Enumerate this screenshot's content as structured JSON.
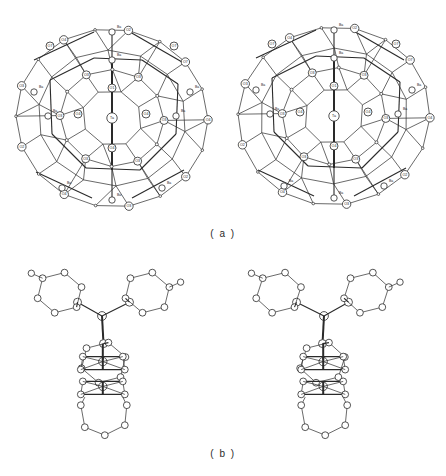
{
  "figure": {
    "type": "crystal-structure-stereo-pair",
    "background_color": "#ffffff",
    "line_color": "#2a2a2a"
  },
  "panels": [
    {
      "id": "a",
      "caption": "( a )",
      "description": "stereo pair of coordination polyhedron cage",
      "views": [
        "left-eye",
        "right-eye"
      ]
    },
    {
      "id": "b",
      "caption": "( b )",
      "description": "stereo pair of Y-shaped fragment",
      "views": [
        "left-eye",
        "right-eye"
      ]
    }
  ],
  "captions": {
    "a": "( a )",
    "b": "( b )"
  },
  "atom_labels": {
    "center": "Ta",
    "cation": "Ba",
    "oxygen_2": "O2",
    "oxygen_3": "O3",
    "oxygen_4": "O4",
    "oxygen_7": "O7",
    "oxygen_1": "O1"
  },
  "chart_data": {
    "type": "scatter",
    "title": "",
    "xlabel": "",
    "ylabel": "",
    "panel_a": {
      "labeled_atoms_left": [
        {
          "label": "O4",
          "x": 37,
          "y": 40
        },
        {
          "label": "Ba",
          "x": 119,
          "y": 30
        },
        {
          "label": "O4",
          "x": 170,
          "y": 40
        },
        {
          "label": "O7",
          "x": 72,
          "y": 72
        },
        {
          "label": "O4",
          "x": 120,
          "y": 65
        },
        {
          "label": "O3",
          "x": 155,
          "y": 68
        },
        {
          "label": "O7",
          "x": 167,
          "y": 70
        },
        {
          "label": "O4",
          "x": 24,
          "y": 90
        },
        {
          "label": "O3",
          "x": 38,
          "y": 89
        },
        {
          "label": "Ba",
          "x": 113,
          "y": 85
        },
        {
          "label": "O3",
          "x": 196,
          "y": 86
        },
        {
          "label": "O2",
          "x": 64,
          "y": 108
        },
        {
          "label": "O3",
          "x": 80,
          "y": 120
        },
        {
          "label": "O1",
          "x": 113,
          "y": 113
        },
        {
          "label": "O2",
          "x": 160,
          "y": 105
        },
        {
          "label": "O3",
          "x": 166,
          "y": 122
        },
        {
          "label": "Ba",
          "x": 178,
          "y": 126
        },
        {
          "label": "O2",
          "x": 23,
          "y": 139
        },
        {
          "label": "Ta",
          "x": 119,
          "y": 136
        },
        {
          "label": "O2",
          "x": 207,
          "y": 136
        },
        {
          "label": "Ba",
          "x": 57,
          "y": 131
        },
        {
          "label": "Ba",
          "x": 36,
          "y": 152
        },
        {
          "label": "O4",
          "x": 80,
          "y": 152
        },
        {
          "label": "O4",
          "x": 148,
          "y": 152
        },
        {
          "label": "Ba",
          "x": 194,
          "y": 152
        },
        {
          "label": "O4",
          "x": 128,
          "y": 167
        },
        {
          "label": "O3",
          "x": 40,
          "y": 177
        },
        {
          "label": "O3",
          "x": 203,
          "y": 175
        },
        {
          "label": "O2",
          "x": 70,
          "y": 186
        },
        {
          "label": "O2",
          "x": 78,
          "y": 187
        },
        {
          "label": "O1",
          "x": 117,
          "y": 185
        },
        {
          "label": "O2",
          "x": 167,
          "y": 186
        },
        {
          "label": "O2",
          "x": 176,
          "y": 187
        },
        {
          "label": "O4",
          "x": 30,
          "y": 196
        },
        {
          "label": "O4",
          "x": 211,
          "y": 193
        },
        {
          "label": "Ba",
          "x": 122,
          "y": 196
        },
        {
          "label": "O3",
          "x": 81,
          "y": 209
        },
        {
          "label": "O3",
          "x": 162,
          "y": 208
        },
        {
          "label": "Ba",
          "x": 135,
          "y": 214
        },
        {
          "label": "O4",
          "x": 70,
          "y": 224
        },
        {
          "label": "O2",
          "x": 126,
          "y": 226
        },
        {
          "label": "O4",
          "x": 185,
          "y": 223
        }
      ]
    },
    "panel_b": {
      "shape": "Y-shaped three-lobed fragment with central node",
      "lobes": 3,
      "ring_size": 6
    }
  }
}
